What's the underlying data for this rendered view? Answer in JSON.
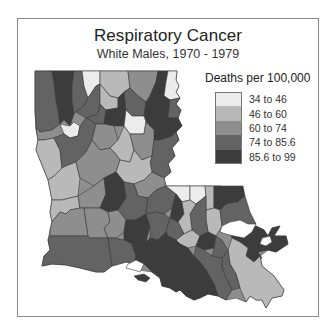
{
  "title": "Respiratory Cancer",
  "subtitle": "White Males, 1970 - 1979",
  "legend": {
    "title": "Deaths per 100,000",
    "items": [
      {
        "label": "34 to 46",
        "color": "#ececec"
      },
      {
        "label": "46 to 60",
        "color": "#b9b9b9"
      },
      {
        "label": "60 to 74",
        "color": "#8e8e8e"
      },
      {
        "label": "74 to 85.6",
        "color": "#636363"
      },
      {
        "label": "85.6 to 99",
        "color": "#3c3c3c"
      }
    ]
  },
  "map": {
    "region": "Louisiana parishes",
    "classes": [
      "34 to 46",
      "46 to 60",
      "60 to 74",
      "74 to 85.6",
      "85.6 to 99"
    ]
  }
}
